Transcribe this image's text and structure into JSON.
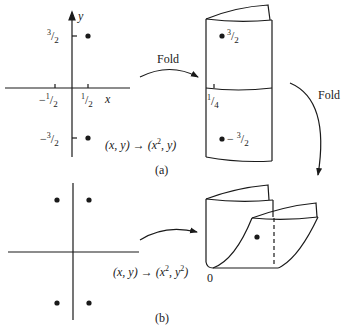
{
  "figure": {
    "panel_a": {
      "caption": "(a)",
      "axis_x_label": "x",
      "axis_y_label": "y",
      "tick_x_neg": {
        "sign": "−",
        "num": "1",
        "den": "2"
      },
      "tick_x_pos": {
        "num": "1",
        "den": "2"
      },
      "tick_y_pos": {
        "num": "3",
        "den": "2"
      },
      "tick_y_neg": {
        "sign": "−",
        "num": "3",
        "den": "2"
      },
      "map_label": {
        "left": "(x, y) → (x",
        "exp": "2",
        "right": ",  y)"
      },
      "arrow_label": "Fold",
      "cylinder": {
        "top_point_label": {
          "num": "3",
          "den": "2"
        },
        "bottom_point_label": {
          "sign": "− ",
          "num": "3",
          "den": "2"
        },
        "seam_label": {
          "num": "1",
          "den": "4"
        }
      },
      "points": [
        {
          "x": 0.5,
          "y": 1.5
        },
        {
          "x": 0.5,
          "y": -1.5
        }
      ]
    },
    "fold_arrow_label": "Fold",
    "panel_b": {
      "caption": "(b)",
      "map_label": {
        "left": "(x, y) → (x",
        "exp1": "2",
        "mid": ", y",
        "exp2": "2",
        "right": ")"
      },
      "origin_label": "0",
      "points": [
        {
          "x": -0.5,
          "y": 1.5
        },
        {
          "x": 0.5,
          "y": 1.5
        },
        {
          "x": -0.5,
          "y": -1.5
        },
        {
          "x": 0.5,
          "y": -1.5
        }
      ]
    }
  }
}
